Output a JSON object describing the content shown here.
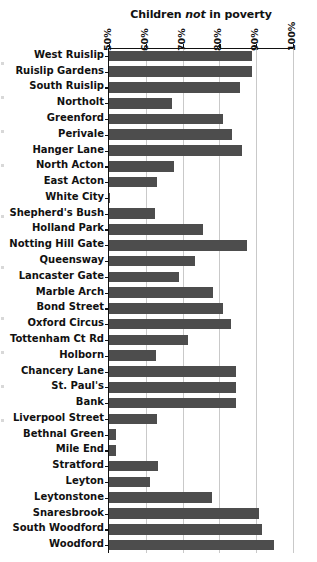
{
  "chart_data": {
    "type": "bar",
    "orientation": "horizontal",
    "title": "Children not in poverty",
    "title_plain": "Children not in poverty",
    "title_prefix": "Children ",
    "title_emphasis": "not",
    "title_suffix": " in poverty",
    "xlabel": "",
    "ylabel": "",
    "xlim": [
      50,
      100
    ],
    "xticks": [
      50,
      60,
      70,
      80,
      90,
      100
    ],
    "xticklabels": [
      "50%",
      "60%",
      "70%",
      "80%",
      "90%",
      "100%"
    ],
    "grid": "vertical",
    "legend": "none",
    "bar_color": "#4d4d4d",
    "axis_color": "#111111",
    "grid_color": "#c9c9c9",
    "categories": [
      "West Ruislip",
      "Ruislip Gardens",
      "South Ruislip",
      "Northolt",
      "Greenford",
      "Perivale",
      "Hanger Lane",
      "North Acton",
      "East Acton",
      "White City",
      "Shepherd's Bush",
      "Holland Park",
      "Notting Hill Gate",
      "Queensway",
      "Lancaster Gate",
      "Marble Arch",
      "Bond Street",
      "Oxford Circus",
      "Tottenham Ct Rd",
      "Holborn",
      "Chancery Lane",
      "St. Paul's",
      "Bank",
      "Liverpool Street",
      "Bethnal Green",
      "Mile End",
      "Stratford",
      "Leyton",
      "Leytonstone",
      "Snaresbrook",
      "South Woodford",
      "Woodford"
    ],
    "values": [
      88.8,
      88.8,
      85.6,
      67.0,
      81.0,
      83.4,
      86.1,
      67.6,
      63.1,
      50.4,
      62.6,
      75.6,
      87.5,
      73.4,
      68.9,
      78.2,
      81.0,
      83.2,
      71.5,
      62.8,
      84.5,
      84.5,
      84.5,
      63.0,
      52.0,
      52.0,
      63.2,
      61.2,
      78.0,
      90.8,
      91.6,
      94.9
    ]
  }
}
